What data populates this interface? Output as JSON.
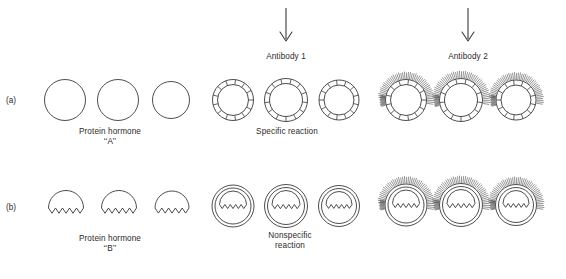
{
  "figure": {
    "background_color": "#ffffff",
    "stroke_color": "#3a3a3a",
    "text_color": "#2b2b2b",
    "width": 566,
    "height": 279
  },
  "rows": [
    {
      "tag": "(a)",
      "hormone_caption_line1": "Protein hormone",
      "hormone_caption_line2": "‘‘A’’",
      "reaction_caption_line1": "Specific reaction",
      "reaction_caption_line2": "",
      "shape": "circle",
      "count": 3
    },
    {
      "tag": "(b)",
      "hormone_caption_line1": "Protein hormone",
      "hormone_caption_line2": "‘‘B’’",
      "reaction_caption_line1": "Nonspecific",
      "reaction_caption_line2": "reaction",
      "shape": "dome-zigzag",
      "count": 3
    }
  ],
  "columns": [
    {
      "key": "native",
      "arrow": false,
      "heading": ""
    },
    {
      "key": "antibody1",
      "arrow": true,
      "heading": "Antibody 1"
    },
    {
      "key": "antibody2",
      "arrow": true,
      "heading": "Antibody 2"
    }
  ],
  "arrows": {
    "glyph": "down-arrow",
    "count": 2
  },
  "chart_data": {
    "type": "diagram",
    "rows": [
      "(a)",
      "(b)"
    ],
    "columns": [
      "native hormone",
      "Antibody 1",
      "Antibody 2"
    ],
    "annotations": [
      "Antibody 1",
      "Antibody 2",
      "Protein hormone ‘‘A’’",
      "Protein hormone ‘‘B’’",
      "Specific reaction",
      "Nonspecific reaction"
    ],
    "units_per_group": 3,
    "segments_per_ring": 13,
    "spikes_per_ring": 46,
    "zigzag_teeth": 5
  }
}
